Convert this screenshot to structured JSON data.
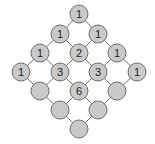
{
  "diagram": {
    "colors": {
      "node_fill": "#c9c9c9",
      "node_stroke": "#6e6e6e",
      "edge": "#6e6e6e",
      "label": "#222222",
      "background": "#ffffff"
    },
    "node_radius": 9,
    "nodes": [
      {
        "id": "r0c0",
        "x": 79,
        "y": 14,
        "label": "1"
      },
      {
        "id": "r1c0",
        "x": 60,
        "y": 34,
        "label": "1"
      },
      {
        "id": "r1c1",
        "x": 98,
        "y": 34,
        "label": "1"
      },
      {
        "id": "r2c0",
        "x": 40,
        "y": 53,
        "label": "1"
      },
      {
        "id": "r2c1",
        "x": 79,
        "y": 53,
        "label": "2"
      },
      {
        "id": "r2c2",
        "x": 117,
        "y": 53,
        "label": "1"
      },
      {
        "id": "r3c0",
        "x": 21,
        "y": 72,
        "label": "1"
      },
      {
        "id": "r3c1",
        "x": 60,
        "y": 72,
        "label": "3"
      },
      {
        "id": "r3c2",
        "x": 98,
        "y": 72,
        "label": "3"
      },
      {
        "id": "r3c3",
        "x": 137,
        "y": 72,
        "label": "1"
      },
      {
        "id": "r4c0",
        "x": 40,
        "y": 91,
        "label": ""
      },
      {
        "id": "r4c1",
        "x": 79,
        "y": 91,
        "label": "6"
      },
      {
        "id": "r4c2",
        "x": 117,
        "y": 91,
        "label": ""
      },
      {
        "id": "r5c0",
        "x": 60,
        "y": 110,
        "label": ""
      },
      {
        "id": "r5c1",
        "x": 98,
        "y": 110,
        "label": ""
      },
      {
        "id": "r6c0",
        "x": 79,
        "y": 129,
        "label": ""
      }
    ],
    "edges": [
      [
        "r0c0",
        "r1c0"
      ],
      [
        "r0c0",
        "r1c1"
      ],
      [
        "r1c0",
        "r2c0"
      ],
      [
        "r1c0",
        "r2c1"
      ],
      [
        "r1c1",
        "r2c1"
      ],
      [
        "r1c1",
        "r2c2"
      ],
      [
        "r2c0",
        "r3c0"
      ],
      [
        "r2c0",
        "r3c1"
      ],
      [
        "r2c1",
        "r3c1"
      ],
      [
        "r2c1",
        "r3c2"
      ],
      [
        "r2c2",
        "r3c2"
      ],
      [
        "r2c2",
        "r3c3"
      ],
      [
        "r3c0",
        "r4c0"
      ],
      [
        "r3c1",
        "r4c0"
      ],
      [
        "r3c1",
        "r4c1"
      ],
      [
        "r3c2",
        "r4c1"
      ],
      [
        "r3c2",
        "r4c2"
      ],
      [
        "r3c3",
        "r4c2"
      ],
      [
        "r4c0",
        "r5c0"
      ],
      [
        "r4c1",
        "r5c0"
      ],
      [
        "r4c1",
        "r5c1"
      ],
      [
        "r4c2",
        "r5c1"
      ],
      [
        "r5c0",
        "r6c0"
      ],
      [
        "r5c1",
        "r6c0"
      ]
    ]
  }
}
